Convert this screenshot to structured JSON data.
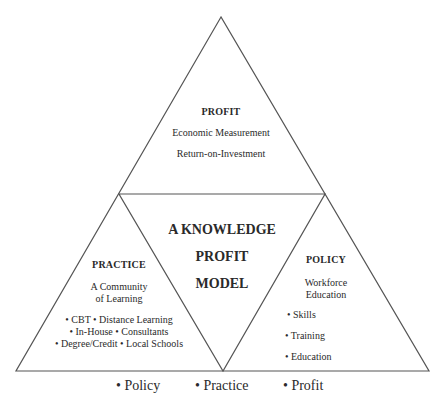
{
  "diagram": {
    "title_lines": [
      "A KNOWLEDGE",
      "PROFIT",
      "MODEL"
    ],
    "top": {
      "heading": "PROFIT",
      "lines": [
        "Economic Measurement",
        "Return-on-Investment"
      ]
    },
    "left": {
      "heading": "PRACTICE",
      "subtitle_lines": [
        "A Community",
        "of Learning"
      ],
      "bullet_lines": [
        "• CBT • Distance Learning",
        "• In-House • Consultants",
        "• Degree/Credit • Local Schools"
      ]
    },
    "right": {
      "heading": "POLICY",
      "subtitle_lines": [
        "Workforce",
        "Education"
      ],
      "bullets": [
        "• Skills",
        "• Training",
        "• Education"
      ]
    },
    "footer": [
      "•  Policy",
      "•  Practice",
      "•  Profit"
    ],
    "line_color": "#555555"
  }
}
